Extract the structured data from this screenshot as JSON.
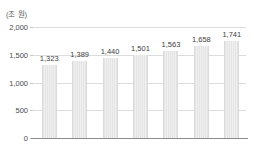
{
  "chart_data": {
    "type": "bar",
    "title": "",
    "subtitle": "",
    "categories": [
      "2014",
      "2015",
      "2016",
      "2017",
      "2018",
      "2019",
      "2020"
    ],
    "values": [
      1323,
      1389,
      1440,
      1501,
      1563,
      1658,
      1741
    ],
    "value_labels": [
      "1,323",
      "1,389",
      "1,440",
      "1,501",
      "1,563",
      "1,658",
      "1,741"
    ],
    "xlabel": "(연도)",
    "ylabel": "(조 원)",
    "ylim": [
      0,
      2000
    ],
    "yticks": [
      0,
      500,
      1000,
      1500,
      2000
    ],
    "ytick_labels": [
      "0",
      "500",
      "1,000",
      "1,500",
      "2,000"
    ],
    "grid": true,
    "legend": false,
    "legend_position": "none",
    "series": [
      {
        "name": "",
        "values": [
          1323,
          1389,
          1440,
          1501,
          1563,
          1658,
          1741
        ]
      }
    ]
  },
  "axes": {
    "y_unit_caption": "(조 원)",
    "x_unit_caption": "(연도)"
  },
  "colors": {
    "bar_fill": "#e9e9e9",
    "bar_stripe": "#e4e4e4",
    "bar_edge": "#dbdbdb",
    "gridline": "#dcdcdc",
    "axis_line": "#8d8d8d",
    "text": "#4a4a4a",
    "value_text": "#3c3c3c",
    "background": "#ffffff"
  }
}
